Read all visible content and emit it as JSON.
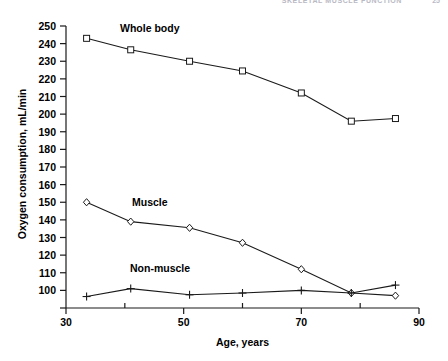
{
  "running_head": {
    "text": "SKELETAL MUSCLE FUNCTION",
    "page": "25"
  },
  "chart_data": {
    "type": "line",
    "title": "",
    "xlabel": "Age, years",
    "ylabel": "Oxygen consumption, mL/min",
    "xlim": [
      30,
      90
    ],
    "ylim": [
      90,
      250
    ],
    "grid": false,
    "legend": "inline-annotations",
    "xticks_major": [
      30,
      50,
      70,
      90
    ],
    "xticks_minor": [
      40,
      60,
      80
    ],
    "xtick_labels": [
      "30",
      "50",
      "70",
      "90"
    ],
    "yticks": [
      100,
      110,
      120,
      130,
      140,
      150,
      160,
      170,
      180,
      190,
      200,
      210,
      220,
      230,
      240,
      250
    ],
    "ytick_labels": [
      "100",
      "110",
      "120",
      "130",
      "140",
      "150",
      "160",
      "170",
      "180",
      "190",
      "200",
      "210",
      "220",
      "230",
      "240",
      "250"
    ],
    "ytick_extra_unlabeled": [
      90
    ],
    "series": [
      {
        "name": "Whole body",
        "marker": "square",
        "x": [
          33.5,
          41,
          51,
          60,
          70,
          78.5,
          86
        ],
        "values": [
          243,
          236.5,
          230,
          224.5,
          212,
          196,
          197.5
        ]
      },
      {
        "name": "Muscle",
        "marker": "diamond",
        "x": [
          33.5,
          41,
          51,
          60,
          70,
          78.5,
          86
        ],
        "values": [
          150,
          139,
          135.5,
          127,
          112,
          98.5,
          97
        ]
      },
      {
        "name": "Non-muscle",
        "marker": "plus",
        "x": [
          33.5,
          41,
          51,
          60,
          70,
          78.5,
          86
        ],
        "values": [
          96.5,
          101,
          97.5,
          98.5,
          100,
          98.5,
          103
        ]
      }
    ],
    "colors": {
      "axis": "#1a1a1a",
      "line": "#1a1a1a",
      "marker_fill": "#ffffff",
      "text": "#000000",
      "background": "#ffffff"
    }
  }
}
